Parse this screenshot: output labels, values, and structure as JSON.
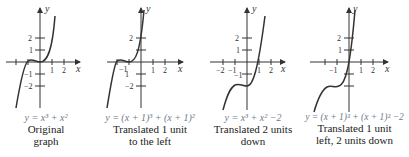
{
  "panels": [
    {
      "id": "original",
      "equation": "y = x³ + x²",
      "description_line1": "Original",
      "description_line2": "graph",
      "shift_x": 0,
      "shift_y": 0,
      "axis_labels": {
        "x": "x",
        "y": "y"
      },
      "x_ticks": [
        "1",
        "2"
      ],
      "y_ticks": [
        "2",
        "1",
        "−1",
        "−2"
      ]
    },
    {
      "id": "left-1",
      "equation": "y = (x + 1)³ + (x + 1)²",
      "description_line1": "Translated 1 unit",
      "description_line2": "to the left",
      "shift_x": -1,
      "shift_y": 0,
      "axis_labels": {
        "x": "x",
        "y": "y"
      },
      "x_ticks": [
        "−1",
        "1",
        "2"
      ],
      "y_ticks": [
        "2",
        "−1",
        "−2"
      ]
    },
    {
      "id": "down-2",
      "equation": "y = x³ + x² −2",
      "description_line1": "Translated 2 units",
      "description_line2": "down",
      "shift_x": 0,
      "shift_y": -2,
      "axis_labels": {
        "x": "x",
        "y": "y"
      },
      "x_ticks": [
        "−2",
        "−1",
        "1",
        "2"
      ],
      "y_ticks": [
        "2",
        "1",
        "−1"
      ]
    },
    {
      "id": "left-1-down-2",
      "equation": "y = (x + 1)³ + (x + 1)² −2",
      "description_line1": "Translated 1 unit",
      "description_line2": "left, 2 units down",
      "shift_x": -1,
      "shift_y": -2,
      "axis_labels": {
        "x": "x",
        "y": "y"
      },
      "x_ticks": [
        "−1",
        "1",
        "2"
      ],
      "y_ticks": [
        "2",
        "1"
      ]
    }
  ]
}
